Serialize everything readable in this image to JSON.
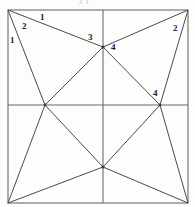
{
  "figure": {
    "title_fragment": "3 1",
    "background_color": "#fdfdfd",
    "line_color": "#4a4a4a",
    "border_color": "#6b6b6b",
    "label_color": "#1b1b1b",
    "square": {
      "left": 8,
      "top": 10,
      "right": 188,
      "bottom": 203
    },
    "nodes": [
      {
        "name": "corner-top-left",
        "x": 8,
        "y": 10
      },
      {
        "name": "corner-top-right",
        "x": 188,
        "y": 10
      },
      {
        "name": "corner-bottom-left",
        "x": 8,
        "y": 203
      },
      {
        "name": "corner-bottom-right",
        "x": 188,
        "y": 203
      },
      {
        "name": "node-top",
        "x": 103,
        "y": 47
      },
      {
        "name": "node-left",
        "x": 45,
        "y": 105
      },
      {
        "name": "node-right",
        "x": 160,
        "y": 105
      },
      {
        "name": "node-bottom",
        "x": 103,
        "y": 167
      }
    ],
    "midlines": {
      "vertical_x": 103,
      "horizontal_y": 105
    },
    "edges": [
      {
        "name": "edge-tl-to-top",
        "x1": 8,
        "y1": 10,
        "x2": 103,
        "y2": 47
      },
      {
        "name": "edge-tl-to-left",
        "x1": 8,
        "y1": 10,
        "x2": 45,
        "y2": 105
      },
      {
        "name": "edge-tr-to-top",
        "x1": 188,
        "y1": 10,
        "x2": 103,
        "y2": 47
      },
      {
        "name": "edge-tr-to-right",
        "x1": 188,
        "y1": 10,
        "x2": 160,
        "y2": 105
      },
      {
        "name": "edge-bl-to-left",
        "x1": 8,
        "y1": 203,
        "x2": 45,
        "y2": 105
      },
      {
        "name": "edge-bl-to-bottom",
        "x1": 8,
        "y1": 203,
        "x2": 103,
        "y2": 167
      },
      {
        "name": "edge-br-to-right",
        "x1": 188,
        "y1": 203,
        "x2": 160,
        "y2": 105
      },
      {
        "name": "edge-br-to-bottom",
        "x1": 188,
        "y1": 203,
        "x2": 103,
        "y2": 167
      },
      {
        "name": "edge-top-to-left",
        "x1": 103,
        "y1": 47,
        "x2": 45,
        "y2": 105
      },
      {
        "name": "edge-top-to-right",
        "x1": 103,
        "y1": 47,
        "x2": 160,
        "y2": 105
      },
      {
        "name": "edge-bottom-to-left",
        "x1": 103,
        "y1": 167,
        "x2": 45,
        "y2": 105
      },
      {
        "name": "edge-bottom-to-right",
        "x1": 103,
        "y1": 167,
        "x2": 160,
        "y2": 105
      }
    ],
    "labels": [
      {
        "name": "label-top-edge-1",
        "text": "1",
        "x": 40,
        "y": 13
      },
      {
        "name": "label-upper-left-2",
        "text": "2",
        "x": 22,
        "y": 22
      },
      {
        "name": "label-left-edge-1",
        "text": "1",
        "x": 10,
        "y": 36
      },
      {
        "name": "label-top-node-3",
        "text": "3",
        "x": 88,
        "y": 33
      },
      {
        "name": "label-top-node-4",
        "text": "4",
        "x": 111,
        "y": 43
      },
      {
        "name": "label-top-right-2",
        "text": "2",
        "x": 173,
        "y": 24
      },
      {
        "name": "label-right-node-4",
        "text": "4",
        "x": 153,
        "y": 89
      }
    ]
  }
}
